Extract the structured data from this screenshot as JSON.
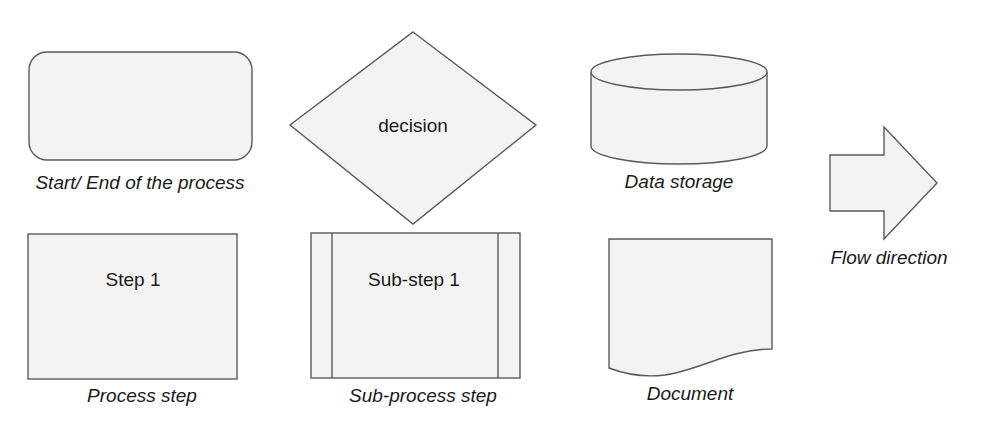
{
  "diagram": {
    "colors": {
      "fill": "#f3f3f3",
      "stroke": "#5a5a5a",
      "text": "#1a1a1a",
      "background": "#ffffff"
    },
    "symbols": [
      {
        "id": "terminator",
        "shape": "rounded-rectangle",
        "inner_text": "",
        "caption": "Start/ End of the process"
      },
      {
        "id": "decision",
        "shape": "diamond",
        "inner_text": "decision",
        "caption": ""
      },
      {
        "id": "data-storage",
        "shape": "cylinder",
        "inner_text": "",
        "caption": "Data storage"
      },
      {
        "id": "flow-direction",
        "shape": "block-arrow",
        "inner_text": "",
        "caption": "Flow direction"
      },
      {
        "id": "process",
        "shape": "rectangle",
        "inner_text": "Step 1",
        "caption": "Process step"
      },
      {
        "id": "sub-process",
        "shape": "rectangle-with-side-bars",
        "inner_text": "Sub-step 1",
        "caption": "Sub-process step"
      },
      {
        "id": "document",
        "shape": "wavy-bottom-rectangle",
        "inner_text": "",
        "caption": "Document"
      }
    ]
  }
}
